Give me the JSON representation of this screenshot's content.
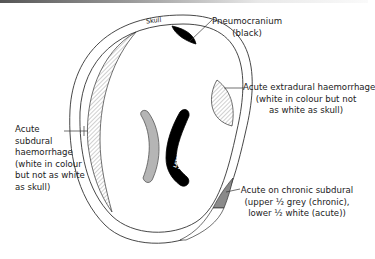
{
  "diagram": {
    "skull_label": "Skull",
    "ventricles_label_line1": "LATERAL",
    "ventricles_label_line2": "VENTRICLES (black)",
    "annotations": {
      "pneumocranium": {
        "line1": "Pneumocranium",
        "line2": "(black)"
      },
      "extradural": {
        "line1": "Acute extradural haemorrhage",
        "line2": "(white in colour but not",
        "line3": "as white as skull)"
      },
      "subdural": {
        "line1": "Acute",
        "line2": "subdural",
        "line3": "haemorrhage",
        "line4": "(white in colour",
        "line5": "but not as white",
        "line6": "as skull)"
      },
      "acute_on_chronic": {
        "line1": "Acute on chronic subdural",
        "line2": "(upper ½ grey (chronic),",
        "line3": "lower ½ white (acute))"
      }
    },
    "colors": {
      "outline": "#333333",
      "pneumocranium": "#000000",
      "left_ventricle": "#b5b5b5",
      "right_ventricle": "#000000",
      "chronic_grey": "#8a8a8a",
      "hatch": "#777777"
    }
  }
}
